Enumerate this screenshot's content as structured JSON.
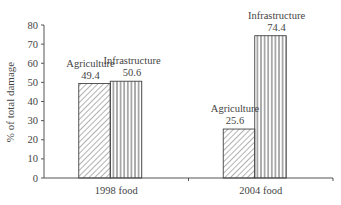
{
  "chart_data": {
    "type": "bar",
    "title": "",
    "xlabel": "",
    "ylabel": "% of total damage",
    "ylim": [
      0,
      80
    ],
    "yticks": [
      0,
      10,
      20,
      30,
      40,
      50,
      60,
      70,
      80
    ],
    "categories": [
      "1998 food",
      "2004 food"
    ],
    "series": [
      {
        "name": "Agriculture",
        "values": [
          49.4,
          25.6
        ],
        "pattern": "diagonal-hatch"
      },
      {
        "name": "Infrastructure",
        "values": [
          50.6,
          74.4
        ],
        "pattern": "vertical-lines"
      }
    ],
    "data_labels": [
      {
        "category": "1998 food",
        "series": "Agriculture",
        "label": "Agriculture",
        "value": "49.4"
      },
      {
        "category": "1998 food",
        "series": "Infrastructure",
        "label": "Infrastructure",
        "value": "50.6"
      },
      {
        "category": "2004 food",
        "series": "Agriculture",
        "label": "Agriculture",
        "value": "25.6"
      },
      {
        "category": "2004 food",
        "series": "Infrastructure",
        "label": "Infrastructure",
        "value": "74.4"
      }
    ],
    "grid": false,
    "legend": "none"
  }
}
